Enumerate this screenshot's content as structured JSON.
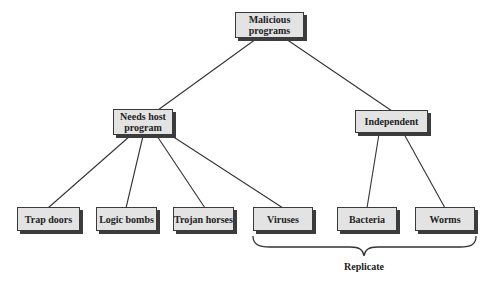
{
  "diagram": {
    "root": {
      "id": "malicious",
      "label": "Malicious\nprograms"
    },
    "level1": [
      {
        "id": "needs_host",
        "label": "Needs host\nprogram"
      },
      {
        "id": "independent",
        "label": "Independent"
      }
    ],
    "leaves": [
      {
        "id": "trap_doors",
        "label": "Trap doors",
        "parent": "needs_host"
      },
      {
        "id": "logic_bombs",
        "label": "Logic bombs",
        "parent": "needs_host"
      },
      {
        "id": "trojan_horses",
        "label": "Trojan horses",
        "parent": "needs_host"
      },
      {
        "id": "viruses",
        "label": "Viruses",
        "parent": "needs_host"
      },
      {
        "id": "bacteria",
        "label": "Bacteria",
        "parent": "independent"
      },
      {
        "id": "worms",
        "label": "Worms",
        "parent": "independent"
      }
    ],
    "brace": {
      "label": "Replicate",
      "spans": [
        "viruses",
        "bacteria",
        "worms"
      ]
    }
  },
  "colors": {
    "box_fill": "#e3e3e3",
    "box_border": "#3a3a3a",
    "box_shadow": "#3c3c3c",
    "line": "#333333",
    "text": "#222222"
  }
}
